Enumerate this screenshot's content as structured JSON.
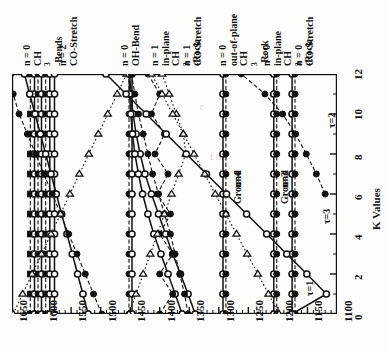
{
  "figure": {
    "orientation": "rotated-90",
    "axis_wavenumber_label": "",
    "axis_k_label": "K Values"
  },
  "background_text": [
    "c",
    "f the",
    "ere",
    "hed"
  ],
  "chart_data": {
    "type": "scatter",
    "title": "",
    "xlabel": "K Values",
    "ylabel": "Wavenumber (cm-1)",
    "xlim": [
      0,
      12
    ],
    "ylim": [
      1100,
      1650
    ],
    "grid": false,
    "legend_position": "none",
    "x_ticks": [
      0,
      2,
      4,
      6,
      8,
      10,
      12
    ],
    "y_ticks": [
      1650,
      1600,
      1550,
      1500,
      1450,
      1400,
      1350,
      1300,
      1250,
      1200,
      1150,
      1100
    ],
    "y_minor_tick_step": 10,
    "x_minor_tick_step": 1,
    "marker_types": [
      "open-circle",
      "filled-circle",
      "open-triangle",
      "filled-square"
    ],
    "mode_labels": [
      {
        "id": "m1",
        "n": "n = 0",
        "mode": "CH3-Bends",
        "wavenumber": 1612
      },
      {
        "id": "m2",
        "n": "n = 2",
        "mode": "CO-Stretch",
        "wavenumber": 1572
      },
      {
        "id": "m3",
        "n": "n = 0",
        "mode": "OH-Bend",
        "wavenumber": 1470
      },
      {
        "id": "m4",
        "n": "n = 1",
        "mode": "in-plane CH3-Rock",
        "wavenumber": 1437
      },
      {
        "id": "m5",
        "n": "n = 1",
        "mode": "CO-Stretch",
        "wavenumber": 1405
      },
      {
        "id": "m6",
        "n": "n = 0",
        "mode": "out-of-plane CH3-Rock",
        "wavenumber": 1352
      },
      {
        "id": "m7",
        "n": "n = 0",
        "mode": "in-plane CH3-Rock",
        "wavenumber": 1305
      },
      {
        "id": "m8",
        "n": "n = 0",
        "mode": "CO-Stretch",
        "wavenumber": 1272
      }
    ],
    "annotations": [
      {
        "text": "n=4",
        "k": 7.4,
        "wavenumber": 1284
      },
      {
        "text": "Ground",
        "k": 6.6,
        "wavenumber": 1284
      },
      {
        "text": "n=3",
        "k": 7.4,
        "wavenumber": 1205
      },
      {
        "text": "Ground",
        "k": 6.6,
        "wavenumber": 1205
      },
      {
        "text": "τ=1",
        "k": 2.0,
        "wavenumber": 1162
      },
      {
        "text": "τ=3",
        "k": 5.6,
        "wavenumber": 1134
      },
      {
        "text": "τ=2",
        "k": 10.4,
        "wavenumber": 1126
      }
    ],
    "series": [
      {
        "name": "CH3-Bends-a",
        "marker": "filled-square",
        "line": "dashed",
        "x": [
          0,
          1,
          2,
          3,
          4,
          5,
          6,
          7,
          8,
          9,
          10,
          11,
          12
        ],
        "values": [
          1619,
          1619,
          1619,
          1619,
          1619,
          1619,
          1619,
          1619,
          1619,
          1619,
          1619,
          1619,
          1619
        ]
      },
      {
        "name": "CH3-Bends-b",
        "marker": "open-circle",
        "line": "solid",
        "x": [
          0,
          1,
          2,
          3,
          4,
          5,
          6,
          7,
          8,
          9,
          10,
          11,
          12
        ],
        "values": [
          1612,
          1612,
          1612,
          1612,
          1612,
          1612,
          1612,
          1612,
          1612,
          1612,
          1612,
          1612,
          1612
        ]
      },
      {
        "name": "CH3-Bends-c",
        "marker": "filled-circle",
        "line": "dashed",
        "x": [
          0,
          1,
          2,
          3,
          4,
          5,
          6,
          7,
          8,
          9,
          10,
          11,
          12
        ],
        "values": [
          1606,
          1606,
          1606,
          1606,
          1606,
          1606,
          1606,
          1606,
          1606,
          1606,
          1606,
          1606,
          1606
        ]
      },
      {
        "name": "CH3-Bends-d",
        "marker": "open-circle",
        "line": "solid",
        "x": [
          0,
          1,
          2,
          3,
          4,
          5,
          6,
          7,
          8,
          9,
          10,
          11,
          12
        ],
        "values": [
          1600,
          1600,
          1600,
          1600,
          1600,
          1600,
          1600,
          1600,
          1600,
          1600,
          1600,
          1600,
          1600
        ]
      },
      {
        "name": "CH3-Bends-e",
        "marker": "filled-square",
        "line": "dashed",
        "x": [
          0,
          1,
          2,
          3,
          4,
          5,
          6,
          7,
          8,
          9,
          10,
          11,
          12
        ],
        "values": [
          1593,
          1593,
          1593,
          1593,
          1593,
          1593,
          1593,
          1593,
          1593,
          1593,
          1593,
          1593,
          1593
        ]
      },
      {
        "name": "CH3-Bends-f",
        "marker": "open-circle",
        "line": "solid",
        "x": [
          0,
          1,
          2,
          3,
          4,
          5,
          6,
          7,
          8,
          9,
          10,
          11,
          12
        ],
        "values": [
          1586,
          1586,
          1586,
          1586,
          1586,
          1586,
          1586,
          1586,
          1586,
          1586,
          1586,
          1586,
          1586
        ]
      },
      {
        "name": "CO-Stretch-n2",
        "marker": "open-circle",
        "line": "solid",
        "x": [
          0,
          1,
          2,
          3,
          4,
          5,
          6,
          7,
          8,
          9,
          10,
          11,
          12
        ],
        "values": [
          1578,
          1578,
          1578,
          1578,
          1578,
          1578,
          1578,
          1578,
          1578,
          1578,
          1578,
          1578,
          1578
        ]
      },
      {
        "name": "ramp-A",
        "marker": "open-circle",
        "line": "solid",
        "x": [
          0,
          1,
          2,
          3,
          4,
          5,
          6,
          7,
          8,
          9,
          10,
          11,
          12
        ],
        "values": [
          1521,
          1530,
          1539,
          1548,
          1557,
          1566,
          1575,
          1584,
          1593,
          1602,
          1611,
          1620,
          1629
        ]
      },
      {
        "name": "ramp-B",
        "marker": "filled-circle",
        "line": "dashed",
        "x": [
          0,
          1,
          2,
          3,
          4,
          5,
          6,
          7,
          8,
          9,
          10,
          11,
          12
        ],
        "values": [
          1498,
          1512,
          1526,
          1540,
          1554,
          1568,
          1582,
          1596,
          1610,
          1624,
          1638,
          1648,
          1652
        ]
      },
      {
        "name": "ramp-C",
        "marker": "open-triangle",
        "line": "dotted",
        "x": [
          0,
          1,
          2,
          3,
          4,
          5,
          6,
          7,
          8,
          9,
          10,
          11,
          12
        ],
        "values": [
          1648,
          1632,
          1616,
          1600,
          1584,
          1568,
          1552,
          1536,
          1520,
          1504,
          1488,
          1472,
          1456
        ]
      },
      {
        "name": "OH-Bend",
        "marker": "filled-circle",
        "line": "dashed",
        "x": [
          0,
          1,
          2,
          3,
          4,
          5,
          6,
          7,
          8,
          9,
          10,
          11,
          12
        ],
        "values": [
          1452,
          1452,
          1452,
          1452,
          1452,
          1452,
          1452,
          1452,
          1452,
          1452,
          1452,
          1452,
          1452
        ]
      },
      {
        "name": "OH-Bend-pair",
        "marker": "open-circle",
        "line": "solid",
        "x": [
          0,
          1,
          2,
          3,
          4,
          5,
          6,
          7,
          8,
          9,
          10,
          11,
          12
        ],
        "values": [
          1447,
          1447,
          1447,
          1447,
          1447,
          1447,
          1447,
          1447,
          1447,
          1447,
          1447,
          1447,
          1447
        ]
      },
      {
        "name": "rock-ramp-up",
        "marker": "open-circle",
        "line": "solid",
        "x": [
          0,
          1,
          2,
          3,
          4,
          5,
          6,
          7,
          8,
          9,
          10,
          11,
          12
        ],
        "values": [
          1340,
          1352,
          1365,
          1378,
          1390,
          1402,
          1414,
          1425,
          1433,
          1440,
          1445,
          1449,
          1451
        ]
      },
      {
        "name": "rock-ramp-up2",
        "marker": "open-circle",
        "line": "solid",
        "x": [
          0,
          1,
          2,
          3,
          4,
          5,
          6,
          7,
          8,
          9,
          10,
          11,
          12
        ],
        "values": [
          1362,
          1374,
          1386,
          1398,
          1410,
          1420,
          1429,
          1436,
          1442,
          1446,
          1449,
          1451,
          1452
        ]
      },
      {
        "name": "rock-zigzag",
        "marker": "filled-circle",
        "line": "dashed",
        "x": [
          0,
          1,
          2,
          3,
          4,
          5,
          6,
          7,
          8,
          9,
          10,
          11,
          12
        ],
        "values": [
          1400,
          1378,
          1400,
          1378,
          1400,
          1382,
          1404,
          1386,
          1408,
          1392,
          1414,
          1400,
          1420
        ]
      },
      {
        "name": "CO-Stretch-n1",
        "marker": "filled-circle",
        "line": "dashed",
        "x": [
          0,
          1,
          2,
          3,
          4,
          5,
          6,
          7,
          8,
          9,
          10,
          11,
          12
        ],
        "values": [
          1352,
          1358,
          1366,
          1374,
          1382,
          1392,
          1402,
          1412,
          1420,
          1428,
          1436,
          1442,
          1448
        ]
      },
      {
        "name": "tri-down",
        "marker": "open-triangle",
        "line": "dotted",
        "x": [
          0,
          1,
          2,
          3,
          4,
          5,
          6,
          7,
          8,
          9,
          10,
          11,
          12
        ],
        "values": [
          1452,
          1440,
          1428,
          1416,
          1404,
          1392,
          1380,
          1368,
          1356,
          1360,
          1372,
          1384,
          1396
        ]
      },
      {
        "name": "oop-rock-n0",
        "marker": "open-circle",
        "line": "solid",
        "x": [
          0,
          1,
          2,
          3,
          4,
          5,
          6,
          7,
          8,
          9,
          10,
          11,
          12
        ],
        "values": [
          1293,
          1293,
          1293,
          1293,
          1293,
          1293,
          1293,
          1293,
          1293,
          1293,
          1293,
          1293,
          1293
        ]
      },
      {
        "name": "oop-rock-n0b",
        "marker": "filled-circle",
        "line": "dashed",
        "x": [
          0,
          1,
          2,
          3,
          4,
          5,
          6,
          7,
          8,
          9,
          10,
          11,
          12
        ],
        "values": [
          1288,
          1288,
          1288,
          1288,
          1288,
          1288,
          1288,
          1288,
          1288,
          1288,
          1288,
          1288,
          1288
        ]
      },
      {
        "name": "ip-rock-n0",
        "marker": "open-circle",
        "line": "solid",
        "x": [
          0,
          1,
          2,
          3,
          4,
          5,
          6,
          7,
          8,
          9,
          10,
          11,
          12
        ],
        "values": [
          1207,
          1207,
          1207,
          1207,
          1207,
          1207,
          1207,
          1207,
          1207,
          1207,
          1207,
          1207,
          1207
        ]
      },
      {
        "name": "ip-rock-n0b",
        "marker": "filled-circle",
        "line": "dashed",
        "x": [
          0,
          1,
          2,
          3,
          4,
          5,
          6,
          7,
          8,
          9,
          10,
          11,
          12
        ],
        "values": [
          1202,
          1202,
          1202,
          1202,
          1202,
          1202,
          1202,
          1202,
          1202,
          1202,
          1202,
          1202,
          1202
        ]
      },
      {
        "name": "CO-Stretch-n0",
        "marker": "open-circle",
        "line": "solid",
        "x": [
          0,
          1,
          2,
          3,
          4,
          5,
          6,
          7,
          8,
          9,
          10,
          11,
          12
        ],
        "values": [
          1176,
          1176,
          1176,
          1176,
          1176,
          1176,
          1176,
          1176,
          1176,
          1176,
          1176,
          1176,
          1176
        ]
      },
      {
        "name": "CO-Stretch-n0b",
        "marker": "filled-circle",
        "line": "dashed",
        "x": [
          0,
          1,
          2,
          3,
          4,
          5,
          6,
          7,
          8,
          9,
          10,
          11,
          12
        ],
        "values": [
          1171,
          1171,
          1171,
          1171,
          1171,
          1171,
          1171,
          1171,
          1171,
          1171,
          1171,
          1171,
          1171
        ]
      },
      {
        "name": "tau1",
        "marker": "open-circle",
        "line": "solid",
        "x": [
          0,
          1,
          2,
          3,
          4,
          5,
          6,
          7,
          8,
          9,
          10,
          11,
          12
        ],
        "values": [
          1176,
          1118,
          1151,
          1185,
          1219,
          1253,
          1287,
          1321,
          1355,
          1389,
          1423,
          1457,
          1491
        ]
      },
      {
        "name": "tau3",
        "marker": "open-triangle",
        "line": "dotted",
        "x": [
          0,
          1,
          2,
          3,
          4,
          5,
          6,
          7,
          8,
          9,
          10,
          11,
          12
        ],
        "values": [
          1198,
          1216,
          1234,
          1252,
          1270,
          1288,
          1306,
          1324,
          1342,
          1360,
          1378,
          1396,
          1414
        ]
      },
      {
        "name": "tau2",
        "marker": "filled-circle",
        "line": "dashed",
        "x": [
          6,
          7,
          8,
          9,
          10,
          11,
          12
        ],
        "values": [
          1120,
          1135,
          1152,
          1170,
          1192,
          1222,
          1262
        ]
      }
    ]
  }
}
